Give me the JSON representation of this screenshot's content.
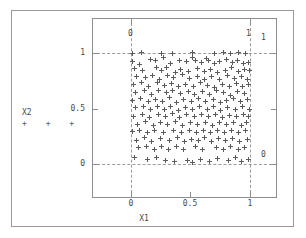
{
  "figure": {
    "x_axis_title": "X1",
    "y_axis_title": "X2",
    "legend_markers": "+  +  +",
    "x_ticks": [
      "0",
      "0.5",
      "1"
    ],
    "y_ticks": [
      "1",
      "0.5",
      "0"
    ],
    "corner_labels": {
      "top_left_inside": "0",
      "top_right_inside": "1",
      "top_right_outside": "1",
      "bottom_right_outside": "0"
    }
  },
  "chart_data": {
    "type": "scatter",
    "title": "",
    "xlabel": "X1",
    "ylabel": "X2",
    "xlim": [
      -0.1,
      1.28
    ],
    "ylim": [
      -0.28,
      1.18
    ],
    "xticks": [
      0,
      0.5,
      1
    ],
    "yticks": [
      0,
      0.5,
      1
    ],
    "xticklabels": [
      "0",
      "0.5",
      "1"
    ],
    "yticklabels": [
      "0",
      "0.5",
      "1"
    ],
    "grid": false,
    "reference_lines": {
      "vertical": [
        0,
        1
      ],
      "horizontal": [
        0,
        1
      ],
      "style": "dashed"
    },
    "legend": {
      "entries": [
        "X2"
      ],
      "marker": "+",
      "position": "left-outside"
    },
    "marker": "+",
    "marker_color": "#5c5c5c",
    "n_points": 208,
    "series": [
      {
        "name": "X2",
        "points": [
          [
            0.015,
            0.995
          ],
          [
            0.085,
            1.005
          ],
          [
            0.255,
            1.0
          ],
          [
            0.345,
            0.998
          ],
          [
            0.52,
            1.002
          ],
          [
            0.7,
            0.997
          ],
          [
            0.775,
            1.003
          ],
          [
            0.84,
            0.999
          ],
          [
            0.905,
            1.001
          ],
          [
            0.965,
            0.995
          ],
          [
            0.01,
            0.925
          ],
          [
            0.07,
            0.9
          ],
          [
            0.165,
            0.945
          ],
          [
            0.205,
            0.93
          ],
          [
            0.27,
            0.955
          ],
          [
            0.33,
            0.905
          ],
          [
            0.405,
            0.935
          ],
          [
            0.47,
            0.92
          ],
          [
            0.52,
            0.96
          ],
          [
            0.545,
            0.93
          ],
          [
            0.59,
            0.915
          ],
          [
            0.635,
            0.95
          ],
          [
            0.655,
            0.935
          ],
          [
            0.7,
            0.905
          ],
          [
            0.745,
            0.925
          ],
          [
            0.8,
            0.94
          ],
          [
            0.85,
            0.91
          ],
          [
            0.895,
            0.93
          ],
          [
            0.945,
            0.905
          ],
          [
            0.985,
            0.915
          ],
          [
            0.03,
            0.86
          ],
          [
            0.1,
            0.845
          ],
          [
            0.215,
            0.87
          ],
          [
            0.26,
            0.84
          ],
          [
            0.3,
            0.865
          ],
          [
            0.37,
            0.825
          ],
          [
            0.42,
            0.855
          ],
          [
            0.485,
            0.83
          ],
          [
            0.56,
            0.86
          ],
          [
            0.615,
            0.835
          ],
          [
            0.67,
            0.855
          ],
          [
            0.73,
            0.82
          ],
          [
            0.79,
            0.845
          ],
          [
            0.845,
            0.87
          ],
          [
            0.9,
            0.83
          ],
          [
            0.955,
            0.855
          ],
          [
            0.995,
            0.84
          ],
          [
            0.05,
            0.79
          ],
          [
            0.125,
            0.775
          ],
          [
            0.18,
            0.8
          ],
          [
            0.24,
            0.765
          ],
          [
            0.305,
            0.795
          ],
          [
            0.36,
            0.775
          ],
          [
            0.43,
            0.805
          ],
          [
            0.495,
            0.77
          ],
          [
            0.555,
            0.79
          ],
          [
            0.62,
            0.76
          ],
          [
            0.68,
            0.785
          ],
          [
            0.74,
            0.765
          ],
          [
            0.81,
            0.795
          ],
          [
            0.87,
            0.77
          ],
          [
            0.93,
            0.79
          ],
          [
            0.98,
            0.76
          ],
          [
            0.02,
            0.72
          ],
          [
            0.09,
            0.735
          ],
          [
            0.15,
            0.7
          ],
          [
            0.225,
            0.73
          ],
          [
            0.285,
            0.705
          ],
          [
            0.34,
            0.725
          ],
          [
            0.395,
            0.695
          ],
          [
            0.46,
            0.72
          ],
          [
            0.525,
            0.7
          ],
          [
            0.585,
            0.73
          ],
          [
            0.645,
            0.705
          ],
          [
            0.705,
            0.69
          ],
          [
            0.765,
            0.715
          ],
          [
            0.825,
            0.7
          ],
          [
            0.885,
            0.725
          ],
          [
            0.94,
            0.695
          ],
          [
            0.99,
            0.72
          ],
          [
            0.04,
            0.645
          ],
          [
            0.11,
            0.665
          ],
          [
            0.175,
            0.63
          ],
          [
            0.235,
            0.66
          ],
          [
            0.295,
            0.64
          ],
          [
            0.35,
            0.665
          ],
          [
            0.415,
            0.635
          ],
          [
            0.48,
            0.655
          ],
          [
            0.535,
            0.625
          ],
          [
            0.6,
            0.65
          ],
          [
            0.66,
            0.63
          ],
          [
            0.72,
            0.66
          ],
          [
            0.78,
            0.64
          ],
          [
            0.835,
            0.615
          ],
          [
            0.895,
            0.65
          ],
          [
            0.95,
            0.635
          ],
          [
            0.015,
            0.575
          ],
          [
            0.08,
            0.59
          ],
          [
            0.145,
            0.56
          ],
          [
            0.21,
            0.585
          ],
          [
            0.265,
            0.565
          ],
          [
            0.325,
            0.595
          ],
          [
            0.385,
            0.555
          ],
          [
            0.445,
            0.58
          ],
          [
            0.51,
            0.56
          ],
          [
            0.57,
            0.59
          ],
          [
            0.63,
            0.565
          ],
          [
            0.69,
            0.585
          ],
          [
            0.75,
            0.555
          ],
          [
            0.805,
            0.575
          ],
          [
            0.86,
            0.59
          ],
          [
            0.92,
            0.56
          ],
          [
            0.975,
            0.585
          ],
          [
            0.035,
            0.505
          ],
          [
            0.105,
            0.52
          ],
          [
            0.16,
            0.49
          ],
          [
            0.22,
            0.515
          ],
          [
            0.28,
            0.495
          ],
          [
            0.335,
            0.52
          ],
          [
            0.4,
            0.485
          ],
          [
            0.455,
            0.51
          ],
          [
            0.515,
            0.49
          ],
          [
            0.575,
            0.515
          ],
          [
            0.64,
            0.495
          ],
          [
            0.695,
            0.52
          ],
          [
            0.755,
            0.485
          ],
          [
            0.815,
            0.505
          ],
          [
            0.875,
            0.49
          ],
          [
            0.935,
            0.515
          ],
          [
            0.995,
            0.495
          ],
          [
            0.025,
            0.43
          ],
          [
            0.095,
            0.45
          ],
          [
            0.155,
            0.42
          ],
          [
            0.23,
            0.445
          ],
          [
            0.29,
            0.425
          ],
          [
            0.345,
            0.455
          ],
          [
            0.41,
            0.42
          ],
          [
            0.465,
            0.445
          ],
          [
            0.53,
            0.43
          ],
          [
            0.595,
            0.45
          ],
          [
            0.65,
            0.425
          ],
          [
            0.71,
            0.445
          ],
          [
            0.77,
            0.42
          ],
          [
            0.83,
            0.44
          ],
          [
            0.89,
            0.425
          ],
          [
            0.945,
            0.45
          ],
          [
            0.985,
            0.43
          ],
          [
            0.055,
            0.36
          ],
          [
            0.12,
            0.38
          ],
          [
            0.185,
            0.35
          ],
          [
            0.25,
            0.375
          ],
          [
            0.31,
            0.355
          ],
          [
            0.375,
            0.38
          ],
          [
            0.435,
            0.35
          ],
          [
            0.5,
            0.37
          ],
          [
            0.56,
            0.355
          ],
          [
            0.625,
            0.375
          ],
          [
            0.685,
            0.35
          ],
          [
            0.745,
            0.37
          ],
          [
            0.8,
            0.355
          ],
          [
            0.865,
            0.375
          ],
          [
            0.925,
            0.35
          ],
          [
            0.97,
            0.37
          ],
          [
            0.01,
            0.29
          ],
          [
            0.075,
            0.305
          ],
          [
            0.14,
            0.28
          ],
          [
            0.2,
            0.3
          ],
          [
            0.275,
            0.285
          ],
          [
            0.355,
            0.305
          ],
          [
            0.425,
            0.28
          ],
          [
            0.49,
            0.3
          ],
          [
            0.55,
            0.285
          ],
          [
            0.61,
            0.305
          ],
          [
            0.665,
            0.28
          ],
          [
            0.725,
            0.3
          ],
          [
            0.785,
            0.285
          ],
          [
            0.845,
            0.305
          ],
          [
            0.905,
            0.28
          ],
          [
            0.96,
            0.3
          ],
          [
            0.045,
            0.215
          ],
          [
            0.115,
            0.235
          ],
          [
            0.17,
            0.205
          ],
          [
            0.245,
            0.23
          ],
          [
            0.32,
            0.21
          ],
          [
            0.39,
            0.235
          ],
          [
            0.45,
            0.205
          ],
          [
            0.505,
            0.225
          ],
          [
            0.565,
            0.21
          ],
          [
            0.62,
            0.235
          ],
          [
            0.675,
            0.205
          ],
          [
            0.735,
            0.23
          ],
          [
            0.795,
            0.21
          ],
          [
            0.855,
            0.23
          ],
          [
            0.915,
            0.205
          ],
          [
            0.98,
            0.225
          ],
          [
            0.06,
            0.145
          ],
          [
            0.13,
            0.16
          ],
          [
            0.195,
            0.135
          ],
          [
            0.26,
            0.155
          ],
          [
            0.315,
            0.13
          ],
          [
            0.38,
            0.155
          ],
          [
            0.44,
            0.135
          ],
          [
            0.54,
            0.155
          ],
          [
            0.605,
            0.13
          ],
          [
            0.715,
            0.15
          ],
          [
            0.775,
            0.13
          ],
          [
            0.84,
            0.155
          ],
          [
            0.9,
            0.135
          ],
          [
            0.955,
            0.15
          ],
          [
            0.03,
            0.06
          ],
          [
            0.14,
            0.04
          ],
          [
            0.215,
            0.055
          ],
          [
            0.29,
            0.03
          ],
          [
            0.365,
            0.02
          ],
          [
            0.475,
            0.035
          ],
          [
            0.52,
            0.015
          ],
          [
            0.585,
            0.045
          ],
          [
            0.66,
            0.02
          ],
          [
            0.73,
            0.05
          ],
          [
            0.82,
            0.03
          ],
          [
            0.88,
            0.055
          ],
          [
            0.93,
            0.02
          ],
          [
            0.99,
            0.045
          ]
        ]
      }
    ]
  }
}
